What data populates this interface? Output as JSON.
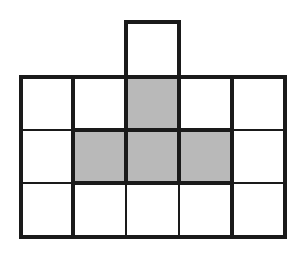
{
  "figure": {
    "type": "grid-diagram",
    "colors": {
      "line": "#1a1a1a",
      "shaded": "#b9b9b9",
      "background": "#ffffff"
    },
    "columns_x": [
      21,
      73,
      126,
      179,
      232,
      285
    ],
    "rows_y": [
      77,
      130,
      183,
      237
    ],
    "top_box": {
      "x1": 126,
      "x2": 179,
      "y1": 22,
      "y2": 77
    },
    "shaded_cells": [
      {
        "row": 0,
        "col": 2
      },
      {
        "row": 1,
        "col": 1
      },
      {
        "row": 1,
        "col": 2
      },
      {
        "row": 1,
        "col": 3
      }
    ],
    "thick_width": 4,
    "thin_width": 2
  }
}
